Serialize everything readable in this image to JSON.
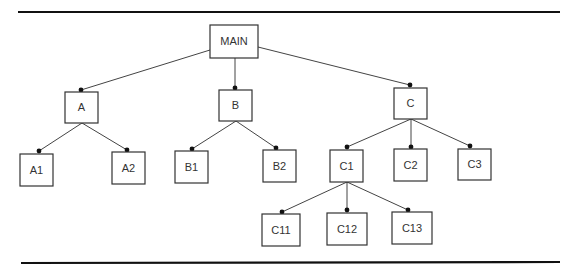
{
  "diagram": {
    "type": "hierarchy-tree",
    "colors": {
      "box_stroke": "#333333",
      "edge": "#444444",
      "dot": "#111111",
      "rule": "#111111",
      "background": "#ffffff"
    },
    "rules": [
      {
        "name": "top-rule",
        "x1": 18,
        "y1": 12,
        "x2": 560,
        "y2": 12
      },
      {
        "name": "bottom-rule",
        "x1": 21,
        "y1": 263,
        "x2": 560,
        "y2": 262
      }
    ],
    "nodes": [
      {
        "id": "MAIN",
        "label": "MAIN",
        "x": 210,
        "y": 25,
        "w": 48,
        "h": 33
      },
      {
        "id": "A",
        "label": "A",
        "x": 65,
        "y": 92,
        "w": 33,
        "h": 31
      },
      {
        "id": "B",
        "label": "B",
        "x": 219,
        "y": 90,
        "w": 33,
        "h": 31
      },
      {
        "id": "C",
        "label": "C",
        "x": 394,
        "y": 88,
        "w": 33,
        "h": 31
      },
      {
        "id": "A1",
        "label": "A1",
        "x": 20,
        "y": 154,
        "w": 33,
        "h": 32
      },
      {
        "id": "A2",
        "label": "A2",
        "x": 112,
        "y": 152,
        "w": 33,
        "h": 32
      },
      {
        "id": "B1",
        "label": "B1",
        "x": 175,
        "y": 151,
        "w": 33,
        "h": 32
      },
      {
        "id": "B2",
        "label": "B2",
        "x": 263,
        "y": 150,
        "w": 33,
        "h": 32
      },
      {
        "id": "C1",
        "label": "C1",
        "x": 330,
        "y": 150,
        "w": 33,
        "h": 32
      },
      {
        "id": "C2",
        "label": "C2",
        "x": 394,
        "y": 149,
        "w": 33,
        "h": 32
      },
      {
        "id": "C3",
        "label": "C3",
        "x": 458,
        "y": 149,
        "w": 33,
        "h": 31
      },
      {
        "id": "C11",
        "label": "C11",
        "x": 262,
        "y": 214,
        "w": 38,
        "h": 32
      },
      {
        "id": "C12",
        "label": "C12",
        "x": 327,
        "y": 213,
        "w": 40,
        "h": 32
      },
      {
        "id": "C13",
        "label": "C13",
        "x": 392,
        "y": 212,
        "w": 40,
        "h": 32
      }
    ],
    "edges": [
      {
        "from": "MAIN",
        "to": "A",
        "x1": 210,
        "y1": 50,
        "x2": 81,
        "y2": 90
      },
      {
        "from": "MAIN",
        "to": "B",
        "x1": 235,
        "y1": 58,
        "x2": 235,
        "y2": 88
      },
      {
        "from": "MAIN",
        "to": "C",
        "x1": 258,
        "y1": 47,
        "x2": 410,
        "y2": 85
      },
      {
        "from": "A",
        "to": "A1",
        "x1": 82,
        "y1": 123,
        "x2": 39,
        "y2": 151
      },
      {
        "from": "A",
        "to": "A2",
        "x1": 82,
        "y1": 123,
        "x2": 127,
        "y2": 150
      },
      {
        "from": "B",
        "to": "B1",
        "x1": 236,
        "y1": 121,
        "x2": 192,
        "y2": 149
      },
      {
        "from": "B",
        "to": "B2",
        "x1": 236,
        "y1": 121,
        "x2": 276,
        "y2": 148
      },
      {
        "from": "C",
        "to": "C1",
        "x1": 411,
        "y1": 119,
        "x2": 347,
        "y2": 147
      },
      {
        "from": "C",
        "to": "C2",
        "x1": 411,
        "y1": 119,
        "x2": 411,
        "y2": 147
      },
      {
        "from": "C",
        "to": "C3",
        "x1": 411,
        "y1": 119,
        "x2": 470,
        "y2": 146
      },
      {
        "from": "C1",
        "to": "C11",
        "x1": 347,
        "y1": 182,
        "x2": 282,
        "y2": 212
      },
      {
        "from": "C1",
        "to": "C12",
        "x1": 347,
        "y1": 182,
        "x2": 347,
        "y2": 210
      },
      {
        "from": "C1",
        "to": "C13",
        "x1": 347,
        "y1": 182,
        "x2": 408,
        "y2": 210
      }
    ]
  }
}
